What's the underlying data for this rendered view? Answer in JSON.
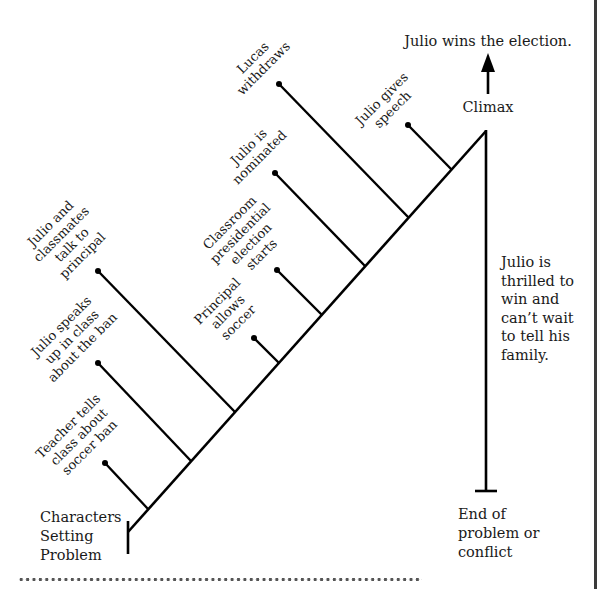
{
  "diagram": {
    "type": "plot-diagram",
    "start_label": [
      "Characters",
      "Setting",
      "Problem"
    ],
    "climax_label": "Climax",
    "climax_result": "Julio wins the election.",
    "falling_action": [
      "Julio is",
      "thrilled to",
      "win and",
      "can’t wait",
      "to tell his",
      "family."
    ],
    "end_label": [
      "End of",
      "problem or",
      "conflict"
    ],
    "events": [
      {
        "id": "e1",
        "lines": [
          "Teacher tells",
          "class about",
          "soccer ban"
        ],
        "junction": [
          148,
          509
        ],
        "dot": [
          105,
          463
        ]
      },
      {
        "id": "e2",
        "lines": [
          "Julio speaks",
          "up in class",
          "about the ban"
        ],
        "junction": [
          191,
          461
        ],
        "dot": [
          98,
          363
        ]
      },
      {
        "id": "e3",
        "lines": [
          "Julio and",
          "classmates",
          "talk to",
          "principal"
        ],
        "junction": [
          235,
          412
        ],
        "dot": [
          98,
          271
        ]
      },
      {
        "id": "e4",
        "lines": [
          "Principal",
          "allows",
          "soccer"
        ],
        "junction": [
          279,
          363
        ],
        "dot": [
          254,
          338
        ]
      },
      {
        "id": "e5",
        "lines": [
          "Classroom",
          "presidential",
          "election",
          "starts"
        ],
        "junction": [
          322,
          315
        ],
        "dot": [
          277,
          270
        ]
      },
      {
        "id": "e6",
        "lines": [
          "Julio is",
          "nominated"
        ],
        "junction": [
          365,
          266
        ],
        "dot": [
          275,
          173
        ]
      },
      {
        "id": "e7",
        "lines": [
          "Lucas",
          "withdraws"
        ],
        "junction": [
          409,
          218
        ],
        "dot": [
          279,
          84
        ]
      },
      {
        "id": "e8",
        "lines": [
          "Julio gives",
          "speech"
        ],
        "junction": [
          452,
          170
        ],
        "dot": [
          408,
          125
        ]
      }
    ],
    "colors": {
      "ink": "#000000",
      "text": "#1a1a1a",
      "background": "#ffffff"
    }
  }
}
